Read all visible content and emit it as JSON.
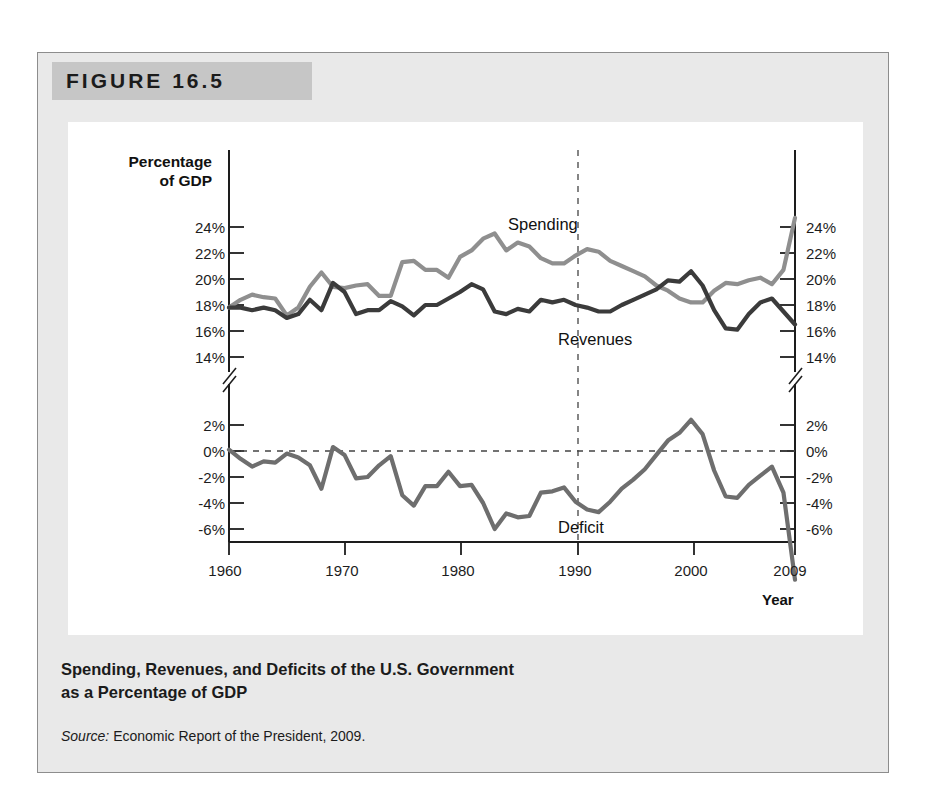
{
  "figure": {
    "number_label": "FIGURE 16.5",
    "caption_line1": "Spending, Revenues, and Deficits of the U.S. Government",
    "caption_line2": "as a Percentage of GDP",
    "source_prefix": "Source:",
    "source_text": "Economic Report of the President, 2009."
  },
  "colors": {
    "page_background": "#ffffff",
    "figure_background": "#e9e9e9",
    "banner_background": "#c6c6c6",
    "plot_background": "#ffffff",
    "spending_line": "#8f8f8f",
    "revenues_line": "#3b3b3b",
    "deficit_line": "#6e6e6e",
    "axis": "#1d1d1d",
    "text": "#1b1b1b"
  },
  "chart_data": {
    "type": "line",
    "title": "Spending, Revenues, and Deficits of the U.S. Government as a Percentage of GDP",
    "subtitle": "",
    "xlabel": "Year",
    "ylabel": "Percentage of GDP",
    "ylabel_line1": "Percentage",
    "ylabel_line2": "of GDP",
    "grid": false,
    "legend_position": "in-plot-annotation",
    "broken_axis": true,
    "axis_break_note": "y-axis broken between 14% and 2%",
    "annotations": [
      {
        "text": "Spending",
        "series": "Spending",
        "x": 1990,
        "y": 23.4
      },
      {
        "text": "Revenues",
        "series": "Revenues",
        "x": 1991,
        "y": 16.6
      },
      {
        "text": "Deficit",
        "series": "Deficit",
        "x": 1991,
        "y": -5.2
      },
      {
        "text": "vertical dashed reference line",
        "x": 1990
      }
    ],
    "upper_panel": {
      "ylim": [
        13,
        25
      ],
      "yticks": [
        14,
        16,
        18,
        20,
        22,
        24
      ],
      "ytick_labels": [
        "14%",
        "16%",
        "18%",
        "20%",
        "22%",
        "24%"
      ]
    },
    "lower_panel": {
      "ylim": [
        -7,
        3
      ],
      "yticks": [
        2,
        0,
        -2,
        -4,
        -6
      ],
      "ytick_labels": [
        "2%",
        "0%",
        "-2%",
        "-4%",
        "-6%"
      ],
      "zero_line": true
    },
    "xlim": [
      1960,
      2009
    ],
    "xticks": [
      1960,
      1970,
      1980,
      1990,
      2000,
      2009
    ],
    "xtick_labels": [
      "1960",
      "1970",
      "1980",
      "1990",
      "2000",
      "2009"
    ],
    "x": [
      1960,
      1961,
      1962,
      1963,
      1964,
      1965,
      1966,
      1967,
      1968,
      1969,
      1970,
      1971,
      1972,
      1973,
      1974,
      1975,
      1976,
      1977,
      1978,
      1979,
      1980,
      1981,
      1982,
      1983,
      1984,
      1985,
      1986,
      1987,
      1988,
      1989,
      1990,
      1991,
      1992,
      1993,
      1994,
      1995,
      1996,
      1997,
      1998,
      1999,
      2000,
      2001,
      2002,
      2003,
      2004,
      2005,
      2006,
      2007,
      2008,
      2009
    ],
    "series": [
      {
        "name": "Spending",
        "color": "#8f8f8f",
        "unit": "% of GDP",
        "values": [
          17.8,
          18.4,
          18.8,
          18.6,
          18.5,
          17.2,
          17.8,
          19.4,
          20.5,
          19.4,
          19.3,
          19.5,
          19.6,
          18.7,
          18.7,
          21.3,
          21.4,
          20.7,
          20.7,
          20.1,
          21.7,
          22.2,
          23.1,
          23.5,
          22.2,
          22.8,
          22.5,
          21.6,
          21.2,
          21.2,
          21.8,
          22.3,
          22.1,
          21.4,
          21.0,
          20.6,
          20.2,
          19.5,
          19.1,
          18.5,
          18.2,
          18.2,
          19.1,
          19.7,
          19.6,
          19.9,
          20.1,
          19.6,
          20.7,
          24.7
        ]
      },
      {
        "name": "Revenues",
        "color": "#3b3b3b",
        "unit": "% of GDP",
        "values": [
          17.8,
          17.8,
          17.6,
          17.8,
          17.6,
          17.0,
          17.3,
          18.4,
          17.6,
          19.7,
          19.0,
          17.3,
          17.6,
          17.6,
          18.3,
          17.9,
          17.2,
          18.0,
          18.0,
          18.5,
          19.0,
          19.6,
          19.2,
          17.5,
          17.3,
          17.7,
          17.5,
          18.4,
          18.2,
          18.4,
          18.0,
          17.8,
          17.5,
          17.5,
          18.0,
          18.4,
          18.8,
          19.2,
          19.9,
          19.8,
          20.6,
          19.5,
          17.6,
          16.2,
          16.1,
          17.3,
          18.2,
          18.5,
          17.5,
          16.5
        ]
      },
      {
        "name": "Deficit",
        "color": "#6e6e6e",
        "unit": "% of GDP",
        "values": [
          0.1,
          -0.6,
          -1.2,
          -0.8,
          -0.9,
          -0.2,
          -0.5,
          -1.1,
          -2.9,
          0.3,
          -0.3,
          -2.1,
          -2.0,
          -1.1,
          -0.4,
          -3.4,
          -4.2,
          -2.7,
          -2.7,
          -1.6,
          -2.7,
          -2.6,
          -4.0,
          -6.0,
          -4.8,
          -5.1,
          -5.0,
          -3.2,
          -3.1,
          -2.8,
          -3.9,
          -4.5,
          -4.7,
          -3.9,
          -2.9,
          -2.2,
          -1.4,
          -0.3,
          0.8,
          1.4,
          2.4,
          1.3,
          -1.5,
          -3.5,
          -3.6,
          -2.6,
          -1.9,
          -1.2,
          -3.2,
          -9.9
        ]
      }
    ]
  },
  "axis_labels": {
    "left_upper": [
      "24%",
      "22%",
      "20%",
      "18%",
      "16%",
      "14%"
    ],
    "left_lower": [
      "2%",
      "0%",
      "-2%",
      "-4%",
      "-6%"
    ],
    "right_upper": [
      "24%",
      "22%",
      "20%",
      "18%",
      "16%",
      "14%"
    ],
    "right_lower": [
      "2%",
      "0%",
      "-2%",
      "-4%",
      "-6%"
    ],
    "x": [
      "1960",
      "1970",
      "1980",
      "1990",
      "2000",
      "2009"
    ],
    "x_title": "Year"
  },
  "series_annotations": {
    "spending": "Spending",
    "revenues": "Revenues",
    "deficit": "Deficit"
  }
}
